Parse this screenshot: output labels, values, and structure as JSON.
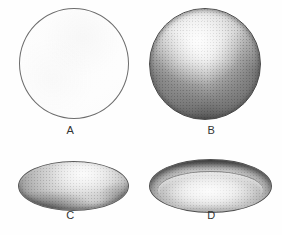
{
  "figure": {
    "background_color": "#ffffff",
    "outline_color": "#6d6d6d",
    "panels": [
      {
        "id": "a",
        "label": "A",
        "shape": "circle",
        "rendering": "outline-only",
        "shaded": false
      },
      {
        "id": "b",
        "label": "B",
        "shape": "circle",
        "rendering": "stippled-shaded-sphere",
        "shaded": true
      },
      {
        "id": "c",
        "label": "C",
        "shape": "ellipse",
        "rendering": "stippled-shaded-convex-ellipsoid",
        "shaded": true
      },
      {
        "id": "d",
        "label": "D",
        "shape": "ellipse",
        "rendering": "stippled-shaded-concave-dish",
        "shaded": true
      }
    ]
  }
}
